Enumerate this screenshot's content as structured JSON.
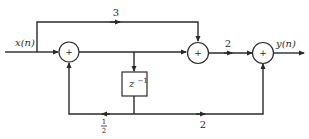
{
  "diagram": {
    "type": "signal-flow block diagram",
    "input_label": "x(n)",
    "output_label": "y(n)",
    "adders": [
      {
        "id": "adder1",
        "symbol": "+"
      },
      {
        "id": "adder2",
        "symbol": "+"
      },
      {
        "id": "adder3",
        "symbol": "+"
      }
    ],
    "delay": {
      "label_base": "z",
      "label_exp": "−1"
    },
    "gains": {
      "feedforward_top": "3",
      "adder2_to_adder3": "2",
      "feedback_left_num": "1",
      "feedback_left_den": "2",
      "feedback_right": "2"
    },
    "colors": {
      "line": "#2a2a2a",
      "background": "#ffffff"
    }
  }
}
